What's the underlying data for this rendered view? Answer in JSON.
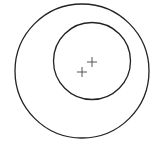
{
  "diagram": {
    "outer_circle": {
      "cx": 82,
      "cy": 71,
      "r": 67,
      "stroke": "#222222"
    },
    "inner_circle": {
      "cx": 92,
      "cy": 61,
      "r": 38.5,
      "stroke": "#222222"
    },
    "markers": [
      {
        "name": "outer-center",
        "x": 82,
        "y": 72
      },
      {
        "name": "inner-center",
        "x": 92,
        "y": 62
      }
    ]
  }
}
